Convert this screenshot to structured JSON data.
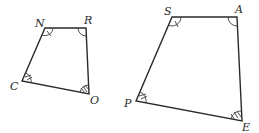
{
  "figure": {
    "quad1": {
      "name": "NROC",
      "vertices": [
        {
          "label": "N",
          "x": 45,
          "y": 28,
          "lx": 35,
          "ly": 27
        },
        {
          "label": "R",
          "x": 86,
          "y": 28,
          "lx": 84,
          "ly": 24
        },
        {
          "label": "O",
          "x": 89,
          "y": 94,
          "lx": 90,
          "ly": 104
        },
        {
          "label": "C",
          "x": 22,
          "y": 81,
          "lx": 10,
          "ly": 90
        }
      ]
    },
    "quad2": {
      "name": "SAPE",
      "vertices": [
        {
          "label": "S",
          "x": 172,
          "y": 17,
          "lx": 164,
          "ly": 15
        },
        {
          "label": "A",
          "x": 237,
          "y": 17,
          "lx": 235,
          "ly": 13
        },
        {
          "label": "E",
          "x": 242,
          "y": 121,
          "lx": 242,
          "ly": 131
        },
        {
          "label": "P",
          "x": 136,
          "y": 101,
          "lx": 124,
          "ly": 107
        }
      ]
    },
    "angle_marks": {
      "N": "single arc with 1 tick",
      "R": "single arc",
      "C": "arc with 2 ticks",
      "O": "arc with 3 ticks",
      "S": "single arc with 1 tick",
      "A": "single arc",
      "P": "arc with 2 ticks",
      "E": "arc with 3 ticks"
    },
    "colors": {
      "stroke": "#2a2a2a",
      "background": "#ffffff"
    }
  }
}
